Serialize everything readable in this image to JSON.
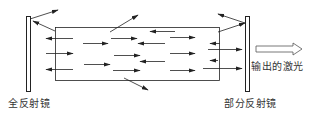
{
  "labels": {
    "left_mirror": "全反射镜",
    "right_mirror": "部分反射镜",
    "output": "输出的激光"
  },
  "colors": {
    "stroke": "#222222",
    "text": "#333333",
    "background": "#ffffff"
  },
  "elements": {
    "left_mirror": {
      "x": 26,
      "y": 16,
      "w": 4,
      "h": 75
    },
    "right_mirror": {
      "x": 245,
      "y": 16,
      "w": 4,
      "h": 75
    },
    "medium_box": {
      "x": 55,
      "y": 27,
      "w": 164,
      "h": 53
    },
    "output_arrow": {
      "x1": 256,
      "x2": 302,
      "y": 49
    }
  },
  "photon_arrows": [
    {
      "x1": 73,
      "y1": 38,
      "x2": 46,
      "y2": 38
    },
    {
      "x1": 83,
      "y1": 43,
      "x2": 108,
      "y2": 43
    },
    {
      "x1": 111,
      "y1": 38,
      "x2": 137,
      "y2": 38
    },
    {
      "x1": 165,
      "y1": 43,
      "x2": 138,
      "y2": 43
    },
    {
      "x1": 46,
      "y1": 53,
      "x2": 73,
      "y2": 53
    },
    {
      "x1": 114,
      "y1": 55,
      "x2": 140,
      "y2": 55
    },
    {
      "x1": 165,
      "y1": 61,
      "x2": 140,
      "y2": 61
    },
    {
      "x1": 73,
      "y1": 69,
      "x2": 46,
      "y2": 69
    },
    {
      "x1": 84,
      "y1": 64,
      "x2": 110,
      "y2": 64
    },
    {
      "x1": 113,
      "y1": 70,
      "x2": 140,
      "y2": 70
    },
    {
      "x1": 175,
      "y1": 31,
      "x2": 150,
      "y2": 31
    },
    {
      "x1": 170,
      "y1": 37,
      "x2": 195,
      "y2": 37
    },
    {
      "x1": 220,
      "y1": 43,
      "x2": 210,
      "y2": 43
    },
    {
      "x1": 208,
      "y1": 49,
      "x2": 242,
      "y2": 49
    },
    {
      "x1": 170,
      "y1": 53,
      "x2": 195,
      "y2": 53
    },
    {
      "x1": 218,
      "y1": 60,
      "x2": 210,
      "y2": 60
    },
    {
      "x1": 203,
      "y1": 68,
      "x2": 242,
      "y2": 68
    },
    {
      "x1": 170,
      "y1": 70,
      "x2": 195,
      "y2": 70
    }
  ],
  "escape_arrows": [
    {
      "x1": 30,
      "y1": 19,
      "x2": 58,
      "y2": 10
    },
    {
      "x1": 55,
      "y1": 31,
      "x2": 33,
      "y2": 21
    },
    {
      "x1": 110,
      "y1": 32,
      "x2": 138,
      "y2": 15
    },
    {
      "x1": 124,
      "y1": 78,
      "x2": 148,
      "y2": 90
    },
    {
      "x1": 218,
      "y1": 32,
      "x2": 245,
      "y2": 23
    },
    {
      "x1": 245,
      "y1": 23,
      "x2": 218,
      "y2": 14
    }
  ]
}
